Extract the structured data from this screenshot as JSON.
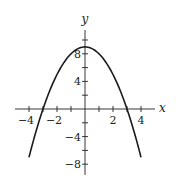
{
  "chart_data": {
    "type": "line",
    "title": "",
    "xlabel": "x",
    "ylabel": "y",
    "function": "y = 9 - x^2",
    "xlim": [
      -5,
      5
    ],
    "ylim": [
      -9.5,
      11.5
    ],
    "x_ticks": [
      -4,
      -3,
      -2,
      -1,
      1,
      2,
      3,
      4
    ],
    "x_tick_labels": [
      {
        "value": -4,
        "label": "−4"
      },
      {
        "value": -2,
        "label": "−2"
      },
      {
        "value": 2,
        "label": "2"
      },
      {
        "value": 4,
        "label": "4"
      }
    ],
    "y_ticks": [
      -8,
      -6,
      -4,
      -2,
      2,
      4,
      6,
      8,
      10
    ],
    "y_tick_labels": [
      {
        "value": 8,
        "label": "8"
      },
      {
        "value": 4,
        "label": "4"
      },
      {
        "value": -4,
        "label": "−4"
      },
      {
        "value": -8,
        "label": "−8"
      }
    ],
    "series": [
      {
        "name": "parabola",
        "x": [
          -4,
          -3.5,
          -3,
          -2.5,
          -2,
          -1.5,
          -1,
          -0.5,
          0,
          0.5,
          1,
          1.5,
          2,
          2.5,
          3,
          3.5,
          4
        ],
        "y": [
          -7,
          -3.25,
          0,
          2.75,
          5,
          6.75,
          8,
          8.75,
          9,
          8.75,
          8,
          6.75,
          5,
          2.75,
          0,
          -3.25,
          -7
        ]
      }
    ],
    "grid": false,
    "legend": "none"
  }
}
